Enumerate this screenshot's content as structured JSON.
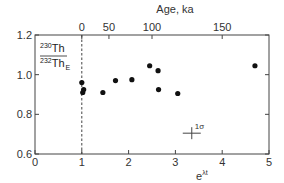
{
  "chart_data": {
    "type": "scatter",
    "title": "",
    "xlabel": "e^{λt}",
    "xlabel_base": "e",
    "xlabel_exp": "λt",
    "ylabel": "230Th/232Th_E",
    "ylabel_num_sup": "230",
    "ylabel_num": "Th",
    "ylabel_den_sup": "232",
    "ylabel_den": "Th",
    "ylabel_den_sub": "E",
    "xlim": [
      0,
      5
    ],
    "ylim": [
      0.6,
      1.2
    ],
    "x_ticks": [
      "0",
      "1",
      "2",
      "3",
      "4",
      "5"
    ],
    "y_ticks": [
      "0.6",
      "0.8",
      "1.0",
      "1.2"
    ],
    "top_axis": {
      "label": "Age, ka",
      "ticks": [
        {
          "label": "0",
          "x": 1.0
        },
        {
          "label": "50",
          "x": 1.58
        },
        {
          "label": "100",
          "x": 2.5
        },
        {
          "label": "150",
          "x": 4.0
        }
      ]
    },
    "reference_line": {
      "x": 1.0,
      "style": "dashed"
    },
    "error_bar_annotation": {
      "label": "1σ",
      "x": 3.35,
      "y": 0.705
    },
    "grid": false,
    "points": [
      {
        "x": 1.0,
        "y": 0.96
      },
      {
        "x": 1.04,
        "y": 0.925
      },
      {
        "x": 1.02,
        "y": 0.91
      },
      {
        "x": 1.45,
        "y": 0.91
      },
      {
        "x": 1.72,
        "y": 0.97
      },
      {
        "x": 2.07,
        "y": 0.975
      },
      {
        "x": 2.45,
        "y": 1.045
      },
      {
        "x": 2.63,
        "y": 1.02
      },
      {
        "x": 2.64,
        "y": 0.925
      },
      {
        "x": 3.05,
        "y": 0.905
      },
      {
        "x": 4.7,
        "y": 1.045
      }
    ]
  },
  "colors": {
    "axis": "#444444",
    "point": "#111111",
    "text": "#333333"
  }
}
